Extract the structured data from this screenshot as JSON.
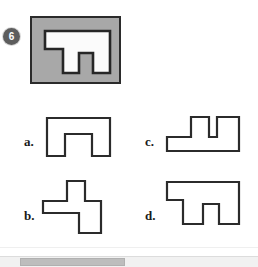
{
  "question": {
    "number": "6",
    "badge_color": "#5d5d5d",
    "prompt_panel_color": "#a8a8a8",
    "outline_color": "#2b2b2b",
    "figure_fill": "#ffffff",
    "prompt_shape_name": "plateau-with-center-notch"
  },
  "options": [
    {
      "key": "a",
      "label": "a.",
      "shape_name": "arch-inverted-u",
      "shape_points": "2,2 65,2 65,40 47,40 47,18 20,18 20,40 2,40"
    },
    {
      "key": "b",
      "label": "b.",
      "shape_name": "offset-cross-tee",
      "shape_points": "26,2 44,2 44,22 60,22 60,54 38,54 38,34 2,34 2,22 26,22"
    },
    {
      "key": "c",
      "label": "c.",
      "shape_name": "double-prong-base",
      "shape_points": "26,2 44,2 44,22 52,22 52,2 74,2 74,36 2,36 2,22 26,22"
    },
    {
      "key": "d",
      "label": "d.",
      "shape_name": "plateau-with-offset-notch",
      "shape_points": "18,2 74,2 74,44 54,44 54,24 38,24 38,44 18,44 18,20 2,20 2,2"
    }
  ],
  "prompt_figure": {
    "shape_points": "2,2 67,2 67,44 50,44 50,24 36,24 36,44 20,44 20,20 2,20"
  },
  "scrollbar": {
    "orientation": "horizontal",
    "track_color": "#f1f1f1",
    "thumb_color": "#bdbdbd"
  }
}
